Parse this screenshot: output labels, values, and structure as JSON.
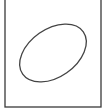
{
  "diagram": {
    "frame": {
      "x": 5,
      "y": -2,
      "width": 96,
      "height": 109,
      "stroke": "#3a3a3a"
    },
    "ellipse": {
      "cx": 53,
      "cy": 53,
      "rx": 37,
      "ry": 24,
      "rotation": -35,
      "stroke": "#444444"
    }
  }
}
